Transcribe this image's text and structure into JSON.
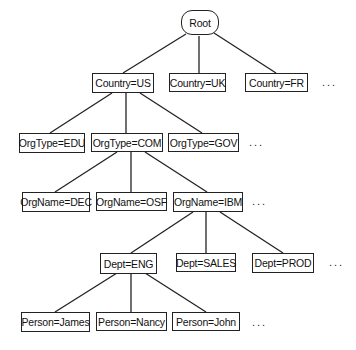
{
  "diagram": {
    "type": "tree",
    "root": {
      "label": "Root"
    },
    "level1": [
      {
        "label": "Country=US"
      },
      {
        "label": "Country=UK"
      },
      {
        "label": "Country=FR"
      }
    ],
    "level2": [
      {
        "label": "OrgType=EDU"
      },
      {
        "label": "OrgType=COM"
      },
      {
        "label": "OrgType=GOV"
      }
    ],
    "level3": [
      {
        "label": "OrgName=DEC"
      },
      {
        "label": "OrgName=OSF"
      },
      {
        "label": "OrgName=IBM"
      }
    ],
    "level4": [
      {
        "label": "Dept=ENG"
      },
      {
        "label": "Dept=SALES"
      },
      {
        "label": "Dept=PROD"
      }
    ],
    "level5": [
      {
        "label": "Person=James"
      },
      {
        "label": "Person=Nancy"
      },
      {
        "label": "Person=John"
      }
    ],
    "ellipsis": "..."
  }
}
